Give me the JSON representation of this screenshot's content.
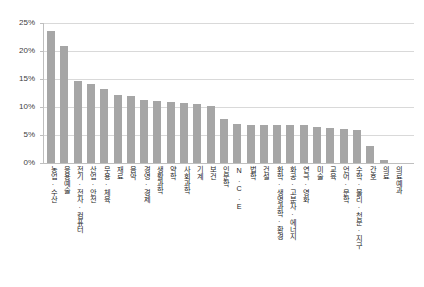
{
  "chart_data": {
    "type": "bar",
    "title": "",
    "xlabel": "",
    "ylabel": "",
    "ylim": [
      0,
      25
    ],
    "ytick_labels": [
      "25%",
      "20%",
      "15%",
      "10%",
      "5%",
      "0%"
    ],
    "ytick_values": [
      25,
      20,
      15,
      10,
      5,
      0
    ],
    "grid": true,
    "legend": "none",
    "bar_color": "#a6a6a6",
    "grid_color": "#d9d9d9",
    "axis_color": "#bfbfbf",
    "categories": [
      "농업·수산",
      "응용예술",
      "전기·전자·컴퓨터",
      "산업·안전",
      "무용·체육",
      "재료",
      "음악",
      "경영·경제",
      "생활과학",
      "약학",
      "사회과학",
      "기계",
      "보건",
      "인문학",
      "N.C.E",
      "법학",
      "건설",
      "화학·생명과학·환경",
      "화공·고분자·에너지",
      "연극·영화",
      "미술",
      "교육",
      "언어·문학",
      "수학·물리·천문·지구",
      "간호",
      "의료",
      "의료예과"
    ],
    "values": [
      23.5,
      20.9,
      14.6,
      14.1,
      13.3,
      12.2,
      12.0,
      11.2,
      11.0,
      10.9,
      10.8,
      10.6,
      10.2,
      7.9,
      6.9,
      6.8,
      6.7,
      6.7,
      6.7,
      6.7,
      6.5,
      6.3,
      6.1,
      5.9,
      3.1,
      0.6,
      0.0
    ]
  }
}
